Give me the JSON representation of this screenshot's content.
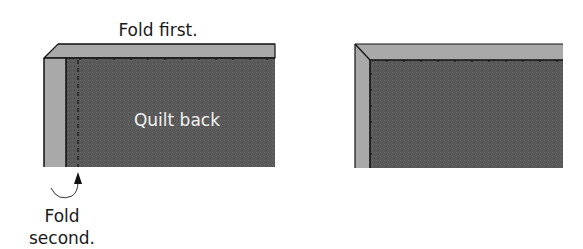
{
  "diagram": {
    "colors": {
      "quilt_back": "#5a5a5a",
      "binding": "#a9a9a9",
      "outline": "#111111",
      "text_dark": "#1a1a1a",
      "text_light": "#f2f2f2"
    },
    "left_panel": {
      "fold_first_label": "Fold first.",
      "quilt_back_label": "Quilt back",
      "fold_second_label_line1": "Fold",
      "fold_second_label_line2": "second.",
      "icons": [
        "curved-arrow-icon",
        "arrow-up-icon"
      ]
    },
    "right_panel": {
      "description": "Result after both folds (mitered corner)"
    }
  }
}
